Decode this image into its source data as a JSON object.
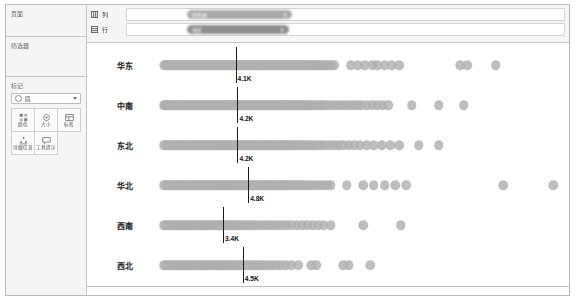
{
  "window": {
    "title": ""
  },
  "sidebar": {
    "pages": {
      "label": "页面"
    },
    "filters": {
      "label": "筛选器"
    },
    "marks": {
      "label": "标记",
      "shape_select_value": "圆",
      "buttons": [
        {
          "label": "颜色",
          "icon": "color-icon"
        },
        {
          "label": "大小",
          "icon": "size-icon"
        },
        {
          "label": "标签",
          "icon": "label-icon"
        },
        {
          "label": "详细信息",
          "icon": "detail-icon"
        },
        {
          "label": "工具提示",
          "icon": "tooltip-icon"
        }
      ]
    }
  },
  "shelves": [
    {
      "name": "列",
      "icon": "columns-icon",
      "pill": "销售额",
      "pill_kind": "measure"
    },
    {
      "name": "行",
      "icon": "rows-icon",
      "pill": "地区",
      "pill_kind": "dimension"
    }
  ],
  "chart_data": {
    "type": "scatter",
    "title": "",
    "xlabel": "",
    "ylabel": "",
    "grid": false,
    "legend": "none",
    "dot_color": "#b0b0b0",
    "reference_line_color": "#1c1c1c",
    "categories": [
      "华东",
      "中南",
      "东北",
      "华北",
      "西南",
      "西北"
    ],
    "reference_label_unit": "K",
    "series": [
      {
        "name": "华东",
        "median_label": "4.1K",
        "median_x": 4.1,
        "x": [
          0.12,
          0.2,
          0.28,
          0.35,
          0.42,
          0.5,
          0.58,
          0.65,
          0.72,
          0.8,
          0.88,
          0.95,
          1.02,
          1.1,
          1.18,
          1.25,
          1.32,
          1.4,
          1.48,
          1.55,
          1.62,
          1.7,
          1.78,
          1.85,
          1.92,
          2.0,
          2.08,
          2.15,
          2.22,
          2.3,
          2.38,
          2.45,
          2.52,
          2.6,
          2.68,
          2.75,
          2.82,
          2.9,
          2.98,
          3.05,
          3.12,
          3.2,
          3.28,
          3.35,
          3.42,
          3.5,
          3.58,
          3.65,
          3.72,
          3.8,
          3.88,
          3.95,
          4.02,
          4.1,
          4.18,
          4.25,
          4.32,
          4.4,
          4.48,
          4.55,
          4.62,
          4.7,
          4.78,
          4.85,
          4.92,
          5.0,
          5.08,
          5.15,
          5.22,
          5.3,
          5.38,
          5.45,
          5.52,
          5.6,
          5.68,
          5.75,
          5.82,
          5.9,
          5.98,
          6.05,
          6.12,
          6.2,
          6.28,
          6.35,
          6.42,
          6.5,
          6.58,
          6.65,
          6.72,
          6.8,
          6.88,
          6.95,
          7.02,
          7.1,
          7.18,
          7.25,
          7.32,
          7.4,
          7.48,
          7.55,
          7.62,
          7.7,
          7.78,
          7.85,
          7.92,
          8.0,
          8.1,
          8.2,
          8.3,
          8.4,
          8.5,
          8.6,
          8.7,
          8.8,
          8.9,
          9.0,
          9.15,
          9.3,
          9.45,
          9.6,
          10.5,
          10.9,
          11.3,
          11.7,
          12.0,
          12.4,
          12.8,
          13.2,
          16.6,
          17.0,
          18.6
        ],
        "count": 129
      },
      {
        "name": "中南",
        "median_label": "4.2K",
        "median_x": 4.2,
        "x": [
          0.1,
          0.18,
          0.26,
          0.34,
          0.42,
          0.5,
          0.58,
          0.66,
          0.74,
          0.82,
          0.9,
          0.98,
          1.06,
          1.14,
          1.22,
          1.3,
          1.38,
          1.46,
          1.54,
          1.62,
          1.7,
          1.78,
          1.86,
          1.94,
          2.02,
          2.1,
          2.18,
          2.26,
          2.34,
          2.42,
          2.5,
          2.58,
          2.66,
          2.74,
          2.82,
          2.9,
          2.98,
          3.06,
          3.14,
          3.22,
          3.3,
          3.38,
          3.46,
          3.54,
          3.62,
          3.7,
          3.78,
          3.86,
          3.94,
          4.02,
          4.1,
          4.18,
          4.26,
          4.34,
          4.42,
          4.5,
          4.58,
          4.66,
          4.74,
          4.82,
          4.9,
          4.98,
          5.06,
          5.14,
          5.22,
          5.3,
          5.38,
          5.46,
          5.54,
          5.62,
          5.7,
          5.78,
          5.86,
          5.94,
          6.02,
          6.1,
          6.18,
          6.26,
          6.34,
          6.42,
          6.5,
          6.58,
          6.66,
          6.74,
          6.82,
          6.9,
          6.98,
          7.06,
          7.14,
          7.22,
          7.3,
          7.38,
          7.46,
          7.54,
          7.62,
          7.7,
          7.8,
          7.9,
          8.0,
          8.1,
          8.2,
          8.35,
          8.5,
          8.65,
          8.8,
          8.95,
          9.1,
          9.3,
          9.5,
          9.7,
          9.9,
          10.1,
          10.3,
          10.5,
          10.7,
          10.9,
          11.1,
          11.4,
          11.7,
          12.0,
          12.3,
          12.6,
          13.9,
          15.4,
          16.8
        ],
        "count": 125
      },
      {
        "name": "东北",
        "median_label": "4.2K",
        "median_x": 4.2,
        "x": [
          0.1,
          0.2,
          0.3,
          0.4,
          0.5,
          0.6,
          0.7,
          0.8,
          0.9,
          1.0,
          1.1,
          1.2,
          1.3,
          1.4,
          1.5,
          1.6,
          1.7,
          1.8,
          1.9,
          2.0,
          2.1,
          2.2,
          2.3,
          2.4,
          2.5,
          2.6,
          2.7,
          2.8,
          2.9,
          3.0,
          3.1,
          3.2,
          3.3,
          3.4,
          3.5,
          3.6,
          3.7,
          3.8,
          3.9,
          4.0,
          4.1,
          4.2,
          4.3,
          4.4,
          4.5,
          4.6,
          4.7,
          4.8,
          4.9,
          5.0,
          5.1,
          5.2,
          5.3,
          5.4,
          5.5,
          5.6,
          5.7,
          5.8,
          5.9,
          6.0,
          6.1,
          6.2,
          6.3,
          6.4,
          6.5,
          6.6,
          6.7,
          6.8,
          6.9,
          7.0,
          7.1,
          7.2,
          7.3,
          7.45,
          7.6,
          7.75,
          7.9,
          8.05,
          8.2,
          8.35,
          8.5,
          8.7,
          8.9,
          9.1,
          9.35,
          9.6,
          9.85,
          10.1,
          10.4,
          10.7,
          11.0,
          11.4,
          11.8,
          12.25,
          12.7,
          13.2,
          14.3,
          15.4
        ],
        "count": 98
      },
      {
        "name": "华北",
        "median_label": "4.8K",
        "median_x": 4.8,
        "x": [
          0.1,
          0.2,
          0.3,
          0.4,
          0.5,
          0.6,
          0.7,
          0.8,
          0.9,
          1.0,
          1.1,
          1.2,
          1.3,
          1.4,
          1.5,
          1.6,
          1.7,
          1.8,
          1.9,
          2.0,
          2.1,
          2.2,
          2.3,
          2.4,
          2.5,
          2.6,
          2.7,
          2.8,
          2.9,
          3.0,
          3.1,
          3.2,
          3.3,
          3.4,
          3.5,
          3.6,
          3.7,
          3.8,
          3.9,
          4.0,
          4.1,
          4.2,
          4.3,
          4.4,
          4.5,
          4.6,
          4.7,
          4.8,
          4.9,
          5.0,
          5.1,
          5.2,
          5.3,
          5.4,
          5.5,
          5.6,
          5.7,
          5.8,
          5.9,
          6.0,
          6.1,
          6.2,
          6.3,
          6.4,
          6.5,
          6.6,
          6.7,
          6.8,
          6.9,
          7.0,
          7.15,
          7.3,
          7.45,
          7.6,
          7.75,
          7.9,
          8.05,
          8.2,
          8.4,
          8.6,
          8.8,
          9.0,
          9.2,
          9.4,
          10.3,
          11.2,
          11.8,
          12.4,
          13.0,
          13.6,
          19.0,
          21.8
        ],
        "count": 92
      },
      {
        "name": "西南",
        "median_label": "3.4K",
        "median_x": 3.4,
        "x": [
          0.1,
          0.22,
          0.34,
          0.46,
          0.58,
          0.7,
          0.82,
          0.94,
          1.06,
          1.18,
          1.3,
          1.42,
          1.54,
          1.66,
          1.78,
          1.9,
          2.02,
          2.14,
          2.26,
          2.38,
          2.5,
          2.62,
          2.74,
          2.86,
          2.98,
          3.1,
          3.22,
          3.34,
          3.46,
          3.58,
          3.7,
          3.82,
          3.94,
          4.06,
          4.18,
          4.3,
          4.45,
          4.6,
          4.75,
          4.9,
          5.05,
          5.2,
          5.4,
          5.6,
          5.8,
          6.0,
          6.2,
          6.45,
          6.7,
          6.95,
          7.2,
          7.5,
          7.8,
          8.1,
          8.4,
          8.7,
          9.0,
          9.4,
          11.2,
          13.3
        ],
        "count": 60
      },
      {
        "name": "西北",
        "median_label": "4.5K",
        "median_x": 4.5,
        "x": [
          0.1,
          0.22,
          0.34,
          0.46,
          0.58,
          0.7,
          0.82,
          0.94,
          1.06,
          1.18,
          1.3,
          1.42,
          1.54,
          1.66,
          1.78,
          1.9,
          2.02,
          2.14,
          2.26,
          2.38,
          2.5,
          2.62,
          2.74,
          2.86,
          2.98,
          3.1,
          3.22,
          3.34,
          3.46,
          3.58,
          3.7,
          3.82,
          3.94,
          4.06,
          4.18,
          4.3,
          4.45,
          4.6,
          4.75,
          4.9,
          5.05,
          5.2,
          5.35,
          5.5,
          5.7,
          5.9,
          6.1,
          6.35,
          6.6,
          6.9,
          7.2,
          7.6,
          8.3,
          8.6,
          10.1,
          10.4,
          11.6
        ],
        "count": 57
      }
    ],
    "xlim": [
      0,
      23
    ]
  }
}
